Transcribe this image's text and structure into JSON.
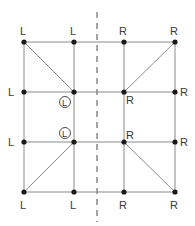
{
  "diagram": {
    "colors": {
      "line": "#8a8a8a",
      "dot": "#1a1a1a",
      "text": "#3a3a3a",
      "axis": "#6a6a6a"
    },
    "columns_x": [
      24,
      74,
      124,
      175
    ],
    "rows_y": [
      42,
      92,
      142,
      192
    ],
    "axis": {
      "x": 97,
      "y1": 12,
      "y2": 222,
      "style": "dashed"
    },
    "points": [
      {
        "id": "p-0-0",
        "x": 24,
        "y": 42,
        "label": "L",
        "label_pos": "above"
      },
      {
        "id": "p-1-0",
        "x": 74,
        "y": 42,
        "label": "L",
        "label_pos": "above"
      },
      {
        "id": "p-2-0",
        "x": 124,
        "y": 42,
        "label": "R",
        "label_pos": "above"
      },
      {
        "id": "p-3-0",
        "x": 175,
        "y": 42,
        "label": "R",
        "label_pos": "above"
      },
      {
        "id": "p-0-1",
        "x": 24,
        "y": 92,
        "label": "L",
        "label_pos": "left"
      },
      {
        "id": "p-1-1",
        "x": 74,
        "y": 92,
        "label": "L",
        "label_pos": "circled-below"
      },
      {
        "id": "p-2-1",
        "x": 124,
        "y": 92,
        "label": "R",
        "label_pos": "below-right"
      },
      {
        "id": "p-3-1",
        "x": 175,
        "y": 92,
        "label": "R",
        "label_pos": "right"
      },
      {
        "id": "p-0-2",
        "x": 24,
        "y": 142,
        "label": "L",
        "label_pos": "left"
      },
      {
        "id": "p-1-2",
        "x": 74,
        "y": 142,
        "label": "L",
        "label_pos": "circled-above"
      },
      {
        "id": "p-2-2",
        "x": 124,
        "y": 142,
        "label": "R",
        "label_pos": "above-right"
      },
      {
        "id": "p-3-2",
        "x": 175,
        "y": 142,
        "label": "R",
        "label_pos": "right"
      },
      {
        "id": "p-0-3",
        "x": 24,
        "y": 192,
        "label": "L",
        "label_pos": "below"
      },
      {
        "id": "p-1-3",
        "x": 74,
        "y": 192,
        "label": "L",
        "label_pos": "below"
      },
      {
        "id": "p-2-3",
        "x": 124,
        "y": 192,
        "label": "R",
        "label_pos": "below"
      },
      {
        "id": "p-3-3",
        "x": 175,
        "y": 192,
        "label": "R",
        "label_pos": "below"
      }
    ],
    "diagonals": [
      {
        "from": "p-0-0",
        "to": "p-1-1"
      },
      {
        "from": "p-2-1",
        "to": "p-3-0"
      },
      {
        "from": "p-0-3",
        "to": "p-1-2"
      },
      {
        "from": "p-2-2",
        "to": "p-3-3"
      }
    ],
    "labels": {
      "top": [
        "L",
        "L",
        "R",
        "R"
      ],
      "row1_left": "L",
      "row1_circled": "L",
      "row1_inner_right": "R",
      "row1_right": "R",
      "row2_left": "L",
      "row2_circled": "L",
      "row2_inner_right": "R",
      "row2_right": "R",
      "bottom": [
        "L",
        "L",
        "R",
        "R"
      ]
    }
  }
}
